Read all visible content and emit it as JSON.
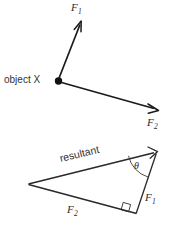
{
  "figure": {
    "background_color": "#ffffff",
    "stroke_color": "#1a1a1a",
    "text_color": "#2b2b2b",
    "width": 179,
    "height": 229
  },
  "top_diagram": {
    "name": "forces-acting-on-object",
    "origin_label": "object X",
    "vectors": [
      {
        "id": "f1",
        "label_main": "F",
        "label_sub": "1",
        "from": [
          58,
          81
        ],
        "to": [
          80,
          21
        ],
        "direction": "up-right"
      },
      {
        "id": "f2",
        "label_main": "F",
        "label_sub": "2",
        "from": [
          58,
          81
        ],
        "to": [
          158,
          110
        ],
        "direction": "down-right"
      }
    ]
  },
  "bottom_diagram": {
    "name": "resultant-vector-triangle",
    "resultant_label": "resultant",
    "angle_label": "θ",
    "right_angle_marker": true,
    "vertices": {
      "left": [
        28,
        184
      ],
      "top_right": [
        157,
        152
      ],
      "bottom_right": [
        136,
        213
      ]
    },
    "sides": [
      {
        "id": "resultant",
        "label": "resultant",
        "from": [
          28,
          184
        ],
        "to": [
          157,
          152
        ]
      },
      {
        "id": "f1",
        "label_main": "F",
        "label_sub": "1",
        "from": [
          136,
          213
        ],
        "to": [
          157,
          152
        ]
      },
      {
        "id": "f2",
        "label_main": "F",
        "label_sub": "2",
        "from": [
          28,
          184
        ],
        "to": [
          136,
          213
        ]
      }
    ]
  }
}
